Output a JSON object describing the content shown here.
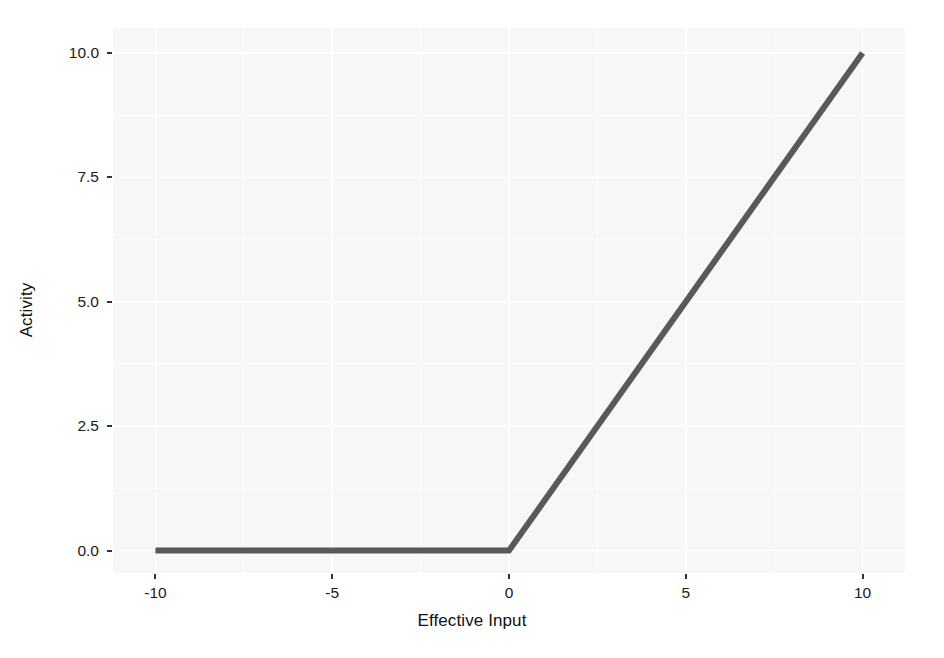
{
  "chart_data": {
    "type": "line",
    "title": "",
    "subtitle": "",
    "xlabel": "Effective Input",
    "ylabel": "Activity",
    "xlim": [
      -11.2,
      11.2
    ],
    "ylim": [
      -0.45,
      10.5
    ],
    "xticks": [
      -10,
      -5,
      0,
      5,
      10
    ],
    "xticklabels": [
      "-10",
      "-5",
      "0",
      "5",
      "10"
    ],
    "yticks": [
      0.0,
      2.5,
      5.0,
      7.5,
      10.0
    ],
    "yticklabels": [
      "0.0",
      "2.5",
      "5.0",
      "7.5",
      "10.0"
    ],
    "grid": true,
    "grid_color": "#ffffff",
    "panel_background": "#f7f7f8",
    "legend": "none",
    "series": [
      {
        "name": "ReLU activation",
        "color": "#595959",
        "linewidth": 4,
        "x": [
          -10,
          -9,
          -8,
          -7,
          -6,
          -5,
          -4,
          -3,
          -2,
          -1,
          0,
          1,
          2,
          3,
          4,
          5,
          6,
          7,
          8,
          9,
          10
        ],
        "y": [
          0,
          0,
          0,
          0,
          0,
          0,
          0,
          0,
          0,
          0,
          0,
          1,
          2,
          3,
          4,
          5,
          6,
          7,
          8,
          9,
          10
        ]
      }
    ],
    "annotations": []
  },
  "axes": {
    "y": {
      "ticks": [
        {
          "label": "10.0",
          "value": 10.0
        },
        {
          "label": "7.5",
          "value": 7.5
        },
        {
          "label": "5.0",
          "value": 5.0
        },
        {
          "label": "2.5",
          "value": 2.5
        },
        {
          "label": "0.0",
          "value": 0.0
        }
      ]
    },
    "x": {
      "ticks": [
        {
          "label": "-10",
          "value": -10
        },
        {
          "label": "-5",
          "value": -5
        },
        {
          "label": "0",
          "value": 0
        },
        {
          "label": "5",
          "value": 5
        },
        {
          "label": "10",
          "value": 10
        }
      ]
    }
  },
  "labels": {
    "x_title": "Effective Input",
    "y_title": "Activity"
  }
}
